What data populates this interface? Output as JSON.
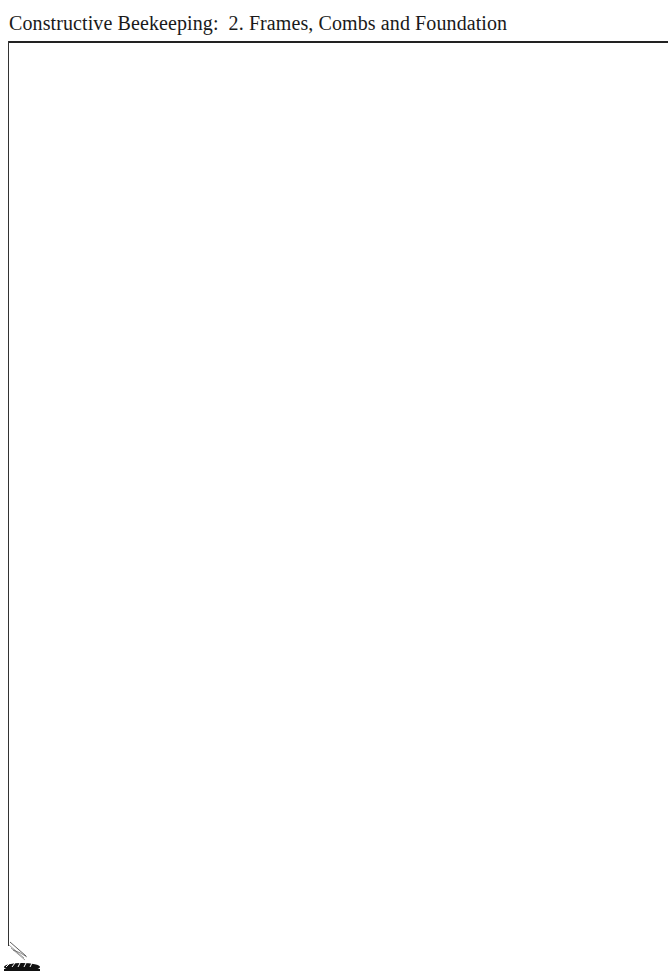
{
  "header": {
    "book_title": "Constructive Beekeeping:",
    "chapter": "2. Frames, Combs and Foundation"
  },
  "decoration": {
    "corner_icon": "bee-icon",
    "rule_color": "#222222"
  },
  "body": {
    "content": ""
  }
}
